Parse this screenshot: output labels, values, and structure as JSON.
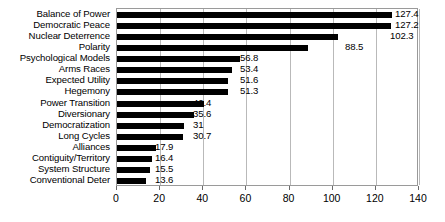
{
  "chart_data": {
    "type": "bar",
    "orientation": "horizontal",
    "title": "",
    "xlabel": "",
    "ylabel": "",
    "xlim": [
      0,
      140
    ],
    "xticks": [
      0,
      20,
      40,
      60,
      80,
      100,
      120,
      140
    ],
    "grid": true,
    "legend": false,
    "bar_color": "#000000",
    "grid_color": "#b9b9b9",
    "axis_color": "#9a9a9a",
    "categories": [
      "Balance of Power",
      "Democratic Peace",
      "Nuclear Deterrence",
      "Polarity",
      "Psychological Models",
      "Arms Races",
      "Expected Utility",
      "Hegemony",
      "Power Transition",
      "Diversionary",
      "Democratization",
      "Long Cycles",
      "Alliances",
      "Contiguity/Territory",
      "System Structure",
      "Conventional Deter"
    ],
    "values": [
      127.4,
      127.2,
      102.3,
      88.5,
      56.8,
      53.4,
      51.6,
      51.3,
      40.4,
      35.6,
      31,
      30.7,
      17.9,
      16.4,
      15.5,
      13.6
    ],
    "value_labels": [
      "127.4",
      "127.2",
      "102.3",
      "88.5",
      "56.8",
      "53.4",
      "51.6",
      "51.3",
      "40.4",
      "35.6",
      "31",
      "30.7",
      "17.9",
      "16.4",
      "15.5",
      "13.6"
    ],
    "value_label_x": [
      395,
      395,
      390,
      345,
      240,
      240,
      240,
      240,
      193,
      193,
      193,
      193,
      155,
      155,
      155,
      155
    ]
  }
}
